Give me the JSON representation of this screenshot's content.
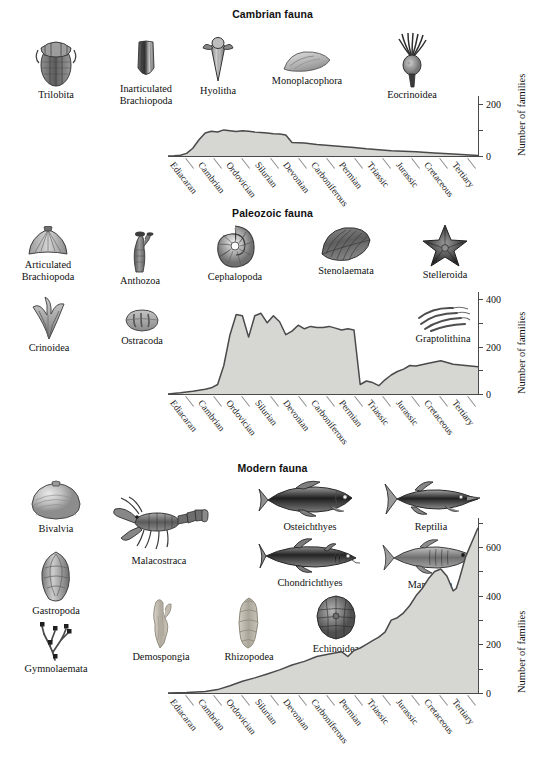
{
  "figure": {
    "type": "scientific-figure",
    "y_axis_label": "Number of families"
  },
  "panels": [
    {
      "id": "cambrian",
      "title": "Cambrian fauna",
      "taxa": [
        {
          "name": "Trilobita",
          "icon": "trilobite-icon"
        },
        {
          "name": "Inarticulated Brachiopoda",
          "icon": "inarticulate-brachiopod-icon"
        },
        {
          "name": "Hyolitha",
          "icon": "hyolith-icon"
        },
        {
          "name": "Monoplacophora",
          "icon": "monoplacophoran-icon"
        },
        {
          "name": "Eocrinoidea",
          "icon": "eocrinoid-icon"
        }
      ],
      "y_ticks": [
        0,
        100,
        200
      ],
      "y_tick_labels": [
        "0",
        "",
        "200"
      ],
      "y_max": 230
    },
    {
      "id": "paleozoic",
      "title": "Paleozoic fauna",
      "taxa": [
        {
          "name": "Articulated Brachiopoda",
          "icon": "articulate-brachiopod-icon"
        },
        {
          "name": "Anthozoa",
          "icon": "coral-icon"
        },
        {
          "name": "Cephalopoda",
          "icon": "nautiloid-icon"
        },
        {
          "name": "Stenolaemata",
          "icon": "bryozoan-icon"
        },
        {
          "name": "Stelleroida",
          "icon": "starfish-icon"
        },
        {
          "name": "Crinoidea",
          "icon": "crinoid-icon"
        },
        {
          "name": "Ostracoda",
          "icon": "ostracod-icon"
        },
        {
          "name": "Graptolithina",
          "icon": "graptolite-icon"
        }
      ],
      "y_ticks": [
        0,
        100,
        200,
        300,
        400
      ],
      "y_tick_labels": [
        "0",
        "",
        "200",
        "",
        "400"
      ],
      "y_max": 430
    },
    {
      "id": "modern",
      "title": "Modern fauna",
      "taxa": [
        {
          "name": "Bivalvia",
          "icon": "clam-icon"
        },
        {
          "name": "Gastropoda",
          "icon": "snail-icon"
        },
        {
          "name": "Gymnolaemata",
          "icon": "bryozoan-branching-icon"
        },
        {
          "name": "Malacostraca",
          "icon": "lobster-icon"
        },
        {
          "name": "Demospongia",
          "icon": "sponge-icon"
        },
        {
          "name": "Rhizopodea",
          "icon": "foraminifera-icon"
        },
        {
          "name": "Osteichthyes",
          "icon": "bony-fish-icon"
        },
        {
          "name": "Chondrichthyes",
          "icon": "shark-icon"
        },
        {
          "name": "Echinoidea",
          "icon": "sea-urchin-icon"
        },
        {
          "name": "Reptilia",
          "icon": "ichthyosaur-icon"
        },
        {
          "name": "Mammalia",
          "icon": "dolphin-icon"
        }
      ],
      "y_ticks": [
        0,
        100,
        200,
        300,
        400,
        500,
        600,
        700
      ],
      "y_tick_labels": [
        "0",
        "",
        "200",
        "",
        "400",
        "",
        "600",
        ""
      ],
      "y_max": 720
    }
  ],
  "periods": [
    "Ediacaran",
    "Cambrian",
    "Ordovician",
    "Silurian",
    "Devonian",
    "Carboniferous",
    "Permian",
    "Triassic",
    "Jurassic",
    "Cretaceous",
    "Tertiary"
  ],
  "chart_data": [
    {
      "type": "area",
      "title": "Cambrian fauna",
      "xlabel": "",
      "ylabel": "Number of families",
      "ylim": [
        0,
        230
      ],
      "yticks": [
        0,
        100,
        200
      ],
      "grid": false,
      "legend": "none",
      "x_categories": [
        "Ediacaran",
        "Cambrian",
        "Ordovician",
        "Silurian",
        "Devonian",
        "Carboniferous",
        "Permian",
        "Triassic",
        "Jurassic",
        "Cretaceous",
        "Tertiary"
      ],
      "x": [
        0,
        2,
        4,
        6,
        8,
        10,
        12,
        14,
        16,
        18,
        20,
        22,
        24,
        26,
        28,
        30,
        32,
        34,
        36,
        38,
        40,
        44,
        48,
        52,
        56,
        60,
        64,
        68,
        72,
        76,
        80,
        86,
        92,
        100
      ],
      "values": [
        0,
        1,
        3,
        10,
        30,
        62,
        88,
        95,
        92,
        100,
        97,
        94,
        97,
        95,
        92,
        90,
        88,
        85,
        84,
        80,
        52,
        50,
        44,
        40,
        36,
        33,
        28,
        24,
        20,
        18,
        16,
        12,
        8,
        2
      ]
    },
    {
      "type": "area",
      "title": "Paleozoic fauna",
      "xlabel": "",
      "ylabel": "Number of families",
      "ylim": [
        0,
        430
      ],
      "yticks": [
        0,
        100,
        200,
        300,
        400
      ],
      "grid": false,
      "legend": "none",
      "x_categories": [
        "Ediacaran",
        "Cambrian",
        "Ordovician",
        "Silurian",
        "Devonian",
        "Carboniferous",
        "Permian",
        "Triassic",
        "Jurassic",
        "Cretaceous",
        "Tertiary"
      ],
      "x": [
        0,
        4,
        8,
        12,
        14,
        16,
        18,
        20,
        22,
        24,
        26,
        28,
        30,
        32,
        34,
        36,
        38,
        40,
        42,
        44,
        46,
        48,
        50,
        52,
        54,
        56,
        58,
        60,
        62,
        64,
        66,
        68,
        70,
        72,
        74,
        76,
        78,
        80,
        84,
        88,
        92,
        96,
        100
      ],
      "values": [
        0,
        5,
        12,
        20,
        26,
        40,
        120,
        250,
        335,
        330,
        240,
        330,
        340,
        300,
        330,
        305,
        250,
        265,
        290,
        275,
        285,
        280,
        280,
        285,
        278,
        270,
        275,
        270,
        40,
        55,
        48,
        35,
        60,
        80,
        95,
        105,
        120,
        118,
        130,
        140,
        125,
        120,
        115
      ]
    },
    {
      "type": "area",
      "title": "Modern fauna",
      "xlabel": "",
      "ylabel": "Number of families",
      "ylim": [
        0,
        720
      ],
      "yticks": [
        0,
        100,
        200,
        300,
        400,
        500,
        600,
        700
      ],
      "grid": false,
      "legend": "none",
      "x_categories": [
        "Ediacaran",
        "Cambrian",
        "Ordovician",
        "Silurian",
        "Devonian",
        "Carboniferous",
        "Permian",
        "Triassic",
        "Jurassic",
        "Cretaceous",
        "Tertiary"
      ],
      "x": [
        0,
        6,
        12,
        16,
        20,
        24,
        28,
        32,
        36,
        40,
        44,
        48,
        52,
        56,
        58,
        60,
        62,
        64,
        66,
        68,
        70,
        72,
        74,
        76,
        78,
        80,
        82,
        84,
        86,
        88,
        90,
        92,
        93,
        94,
        96,
        98,
        100
      ],
      "values": [
        0,
        2,
        6,
        14,
        30,
        48,
        62,
        78,
        95,
        115,
        130,
        150,
        160,
        170,
        150,
        175,
        185,
        200,
        215,
        230,
        250,
        300,
        310,
        330,
        360,
        400,
        430,
        470,
        500,
        510,
        480,
        420,
        430,
        470,
        560,
        620,
        680
      ]
    }
  ]
}
